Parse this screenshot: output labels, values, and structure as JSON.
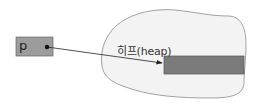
{
  "diagram": {
    "pointer": {
      "label": "p",
      "fill": "#9c9c9c"
    },
    "heap": {
      "label": "히프(heap)",
      "region_fill": "#f3f3f3",
      "block_fill": "#7b7b7b"
    }
  }
}
